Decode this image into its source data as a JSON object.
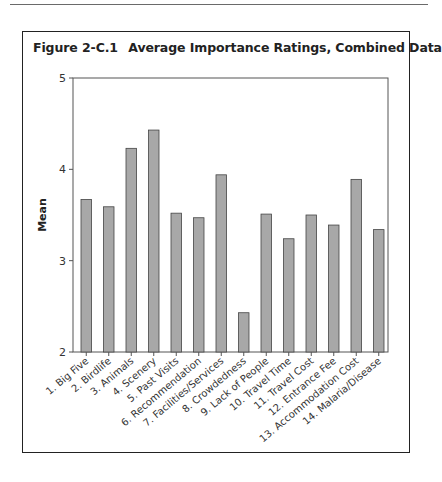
{
  "figure": {
    "number": "Figure 2-C.1",
    "title": "Average Importance Ratings, Combined Data"
  },
  "colors": {
    "bar_fill": "#a8a8a8",
    "bar_stroke": "#444444",
    "axis": "#555555",
    "text": "#333333"
  },
  "chart_data": {
    "type": "bar",
    "title": "Average Importance Ratings, Combined Data",
    "xlabel": "",
    "ylabel": "Mean",
    "ylim": [
      2,
      5
    ],
    "yticks": [
      2,
      3,
      4,
      5
    ],
    "grid": false,
    "legend": null,
    "categories": [
      "1. Big Five",
      "2. Birdlife",
      "3. Animals",
      "4. Scenery",
      "5. Past Visits",
      "6. Recommendation",
      "7. Facilities/Services",
      "8. Crowdedness",
      "9. Lack of People",
      "10. Travel Time",
      "11. Travel Cost",
      "12. Entrance Fee",
      "13. Accommodation Cost",
      "14. Malaria/Disease"
    ],
    "values": [
      3.67,
      3.59,
      4.23,
      4.43,
      3.52,
      3.47,
      3.94,
      2.43,
      3.51,
      3.24,
      3.5,
      3.39,
      3.89,
      3.34
    ]
  }
}
